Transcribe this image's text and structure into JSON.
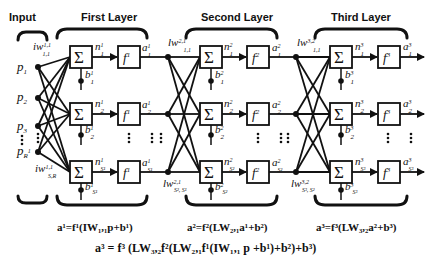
{
  "headers": {
    "input": "Input",
    "layer1": "First Layer",
    "layer2": "Second Layer",
    "layer3": "Third Layer"
  },
  "inputs": [
    {
      "base": "p",
      "sub": "1"
    },
    {
      "base": "p",
      "sub": "2"
    },
    {
      "base": "p",
      "sub": "3"
    },
    {
      "base": "p",
      "sub": "R",
      "sup": "1"
    }
  ],
  "weights": {
    "iw_top": {
      "base": "iw",
      "sup": "1,1",
      "sub": "1,1"
    },
    "iw_bottom": {
      "base": "iw",
      "sup": "1,1",
      "sub": "S,R"
    },
    "lw21_top": {
      "base": "lw",
      "sup": "2,1",
      "sub": "1,1"
    },
    "lw21_bottom": {
      "base": "lw",
      "sup": "2,1",
      "sub": "S², S¹"
    },
    "lw32_top": {
      "base": "lw",
      "sup": "3,2",
      "sub": "1,1"
    },
    "lw32_bottom": {
      "base": "lw",
      "sup": "3,2",
      "sub": "S³, S²"
    }
  },
  "layers": [
    {
      "sum_symbol": "Σ",
      "func": "f",
      "func_sup": "1",
      "rows": [
        {
          "n": "n",
          "n_sup": "1",
          "n_sub": "1",
          "a": "a",
          "a_sup": "1",
          "a_sub": "1",
          "b": "b",
          "b_sup": "1",
          "b_sub": "1"
        },
        {
          "n": "n",
          "n_sup": "1",
          "n_sub": "2",
          "a": "a",
          "a_sup": "1",
          "a_sub": "2",
          "b": "b",
          "b_sup": "1",
          "b_sub": "2"
        },
        {
          "n": "n",
          "n_sup": "1",
          "n_sub": "S¹",
          "a": "a",
          "a_sup": "1",
          "a_sub": "S¹",
          "b": "b",
          "b_sup": "1",
          "b_sub": "S¹"
        }
      ]
    },
    {
      "sum_symbol": "Σ",
      "func": "f",
      "func_sup": "2",
      "rows": [
        {
          "n": "n",
          "n_sup": "2",
          "n_sub": "1",
          "a": "a",
          "a_sup": "2",
          "a_sub": "1",
          "b": "b",
          "b_sup": "2",
          "b_sub": "1"
        },
        {
          "n": "n",
          "n_sup": "2",
          "n_sub": "2",
          "a": "a",
          "a_sup": "2",
          "a_sub": "2",
          "b": "b",
          "b_sup": "2",
          "b_sub": "2"
        },
        {
          "n": "n",
          "n_sup": "2",
          "n_sub": "S²",
          "a": "a",
          "a_sup": "2",
          "a_sub": "S²",
          "b": "b",
          "b_sup": "2",
          "b_sub": "S²"
        }
      ]
    },
    {
      "sum_symbol": "Σ",
      "func": "f",
      "func_sup": "3",
      "rows": [
        {
          "n": "n",
          "n_sup": "3",
          "n_sub": "1",
          "a": "a",
          "a_sup": "3",
          "a_sub": "1",
          "b": "b",
          "b_sup": "3",
          "b_sub": "1"
        },
        {
          "n": "n",
          "n_sup": "3",
          "n_sub": "2",
          "a": "a",
          "a_sup": "3",
          "a_sub": "2",
          "b": "b",
          "b_sup": "3",
          "b_sub": "2"
        },
        {
          "n": "n",
          "n_sup": "3",
          "n_sub": "S³",
          "a": "a",
          "a_sup": "3",
          "a_sub": "S³",
          "b": "b",
          "b_sup": "3",
          "b_sub": "S³"
        }
      ]
    }
  ],
  "equations": {
    "layer1": "a¹=f¹(IW₁,₁p+b¹)",
    "layer2": "a²=f²(LW₂,₁a¹+b²)",
    "layer3": "a³=f³(LW₃,₂a²+b³)",
    "overall": "a³ = f³ (LW₃,₂f²(LW₂,₁f¹(IW₁,₁ p +b¹)+b²)+b³)"
  }
}
